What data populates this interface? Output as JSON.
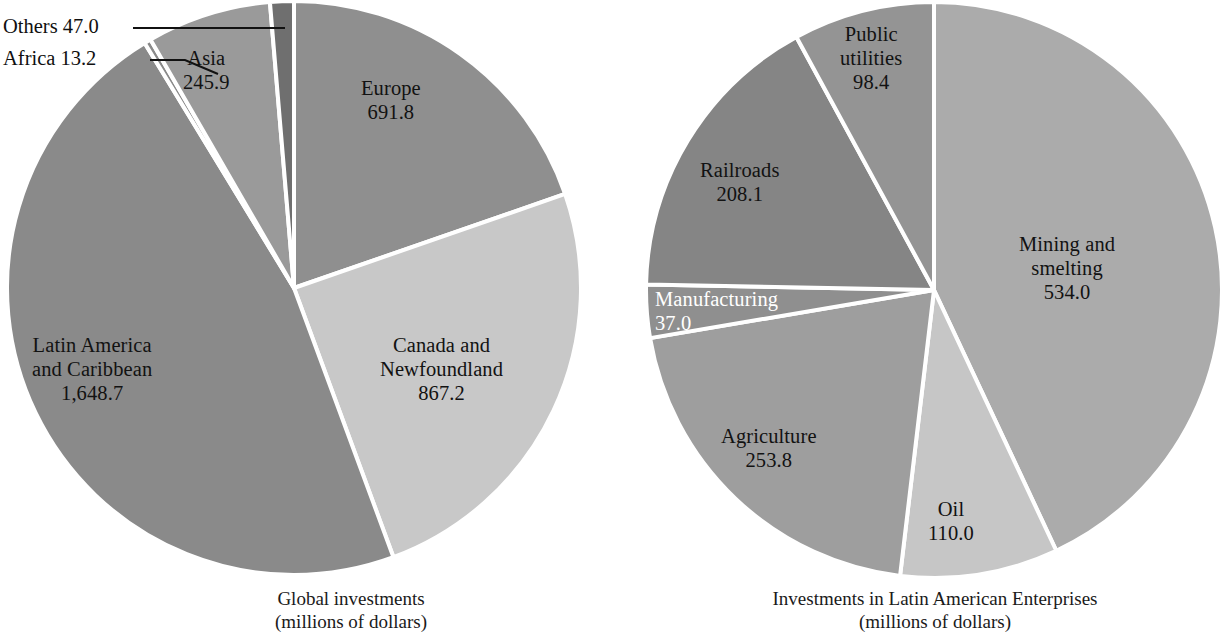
{
  "figure": {
    "background": "#ffffff",
    "label_color": "#121212",
    "divider_color": "#ffffff"
  },
  "chart_data": [
    {
      "type": "pie",
      "id": "global-investments",
      "title": "Global investments",
      "subtitle": "(millions of dollars)",
      "units": "millions of dollars",
      "total": 3513.8,
      "center": [
        294,
        288
      ],
      "radius": 287,
      "start_angle_deg": -90,
      "direction": "clockwise",
      "categories": [
        "Europe",
        "Canada and Newfoundland",
        "Latin America and Caribbean",
        "Africa",
        "Asia",
        "Others"
      ],
      "values": [
        691.8,
        867.2,
        1648.7,
        13.2,
        245.9,
        47.0
      ],
      "labels": [
        "691.8",
        "867.2",
        "1,648.7",
        "13.2",
        "245.9",
        "47.0"
      ],
      "slices": [
        {
          "name": "Europe",
          "label": "Europe",
          "value_text": "691.8",
          "value": 691.8,
          "color": "#8f8f8f",
          "label_pos": [
            361,
            76
          ],
          "label_placement": "inside",
          "text_color": "#121212"
        },
        {
          "name": "Canada and Newfoundland",
          "label": "Canada and\nNewfoundland",
          "value_text": "867.2",
          "value": 867.2,
          "color": "#c8c8c8",
          "label_pos": [
            380,
            333
          ],
          "label_placement": "inside",
          "text_color": "#121212"
        },
        {
          "name": "Latin America and Caribbean",
          "label": "Latin America\nand Caribbean",
          "value_text": "1,648.7",
          "value": 1648.7,
          "color": "#8a8a8a",
          "label_pos": [
            32,
            333
          ],
          "label_placement": "inside",
          "text_color": "#121212"
        },
        {
          "name": "Africa",
          "label": "Africa",
          "value_text": "13.2",
          "value": 13.2,
          "color": "#8a8a8a",
          "label_placement": "callout",
          "callout_text": "Africa  13.2",
          "callout_pos": [
            3,
            47
          ],
          "leader": [
            [
              150,
              60
            ],
            [
              185,
              60
            ],
            [
              218,
              74
            ]
          ]
        },
        {
          "name": "Asia",
          "label": "Asia",
          "value_text": "245.9",
          "value": 245.9,
          "color": "#9a9a9a",
          "label_pos": [
            183,
            46
          ],
          "label_placement": "inside",
          "text_color": "#121212"
        },
        {
          "name": "Others",
          "label": "Others",
          "value_text": "47.0",
          "value": 47.0,
          "color": "#6f6f6f",
          "label_placement": "callout",
          "callout_text": "Others  47.0",
          "callout_pos": [
            3,
            15
          ],
          "leader": [
            [
              133,
              28
            ],
            [
              285,
              28
            ]
          ]
        }
      ]
    },
    {
      "type": "pie",
      "id": "latin-american-enterprises",
      "title": "Investments in Latin American Enterprises",
      "subtitle": "(millions of dollars)",
      "units": "millions of dollars",
      "total": 1241.3,
      "center": [
        934,
        290
      ],
      "radius": 288,
      "start_angle_deg": -90,
      "direction": "clockwise",
      "categories": [
        "Mining and smelting",
        "Oil",
        "Agriculture",
        "Manufacturing",
        "Railroads",
        "Public utilities"
      ],
      "values": [
        534.0,
        110.0,
        253.8,
        37.0,
        208.1,
        98.4
      ],
      "labels": [
        "534.0",
        "110.0",
        "253.8",
        "37.0",
        "208.1",
        "98.4"
      ],
      "slices": [
        {
          "name": "Mining and smelting",
          "label": "Mining and\nsmelting",
          "value_text": "534.0",
          "value": 534.0,
          "color": "#ababab",
          "label_pos": [
            1019,
            232
          ],
          "label_placement": "inside",
          "text_color": "#121212"
        },
        {
          "name": "Oil",
          "label": "Oil",
          "value_text": "110.0",
          "value": 110.0,
          "color": "#c6c6c6",
          "label_pos": [
            928,
            497
          ],
          "label_placement": "inside",
          "text_color": "#121212"
        },
        {
          "name": "Agriculture",
          "label": "Agriculture",
          "value_text": "253.8",
          "value": 253.8,
          "color": "#9e9e9e",
          "label_pos": [
            721,
            424
          ],
          "label_placement": "inside",
          "text_color": "#121212"
        },
        {
          "name": "Manufacturing",
          "label": "Manufacturing",
          "value_text": "37.0",
          "value": 37.0,
          "color": "#8f8f8f",
          "label_pos": [
            655,
            287
          ],
          "label_placement": "inside",
          "text_color": "#ffffff",
          "label_align": "left"
        },
        {
          "name": "Railroads",
          "label": "Railroads",
          "value_text": "208.1",
          "value": 208.1,
          "color": "#858585",
          "label_pos": [
            700,
            158
          ],
          "label_placement": "inside",
          "text_color": "#121212"
        },
        {
          "name": "Public utilities",
          "label": "Public\nutilities",
          "value_text": "98.4",
          "value": 98.4,
          "color": "#949494",
          "label_pos": [
            840,
            22
          ],
          "label_placement": "inside",
          "text_color": "#121212"
        }
      ]
    }
  ],
  "captions": [
    {
      "name": "left-caption",
      "text": "Global investments\n(millions of dollars)",
      "pos": [
        206,
        588
      ],
      "width": 290
    },
    {
      "name": "right-caption",
      "text": "Investments in Latin American Enterprises\n(millions of dollars)",
      "pos": [
        690,
        588
      ],
      "width": 490
    }
  ]
}
